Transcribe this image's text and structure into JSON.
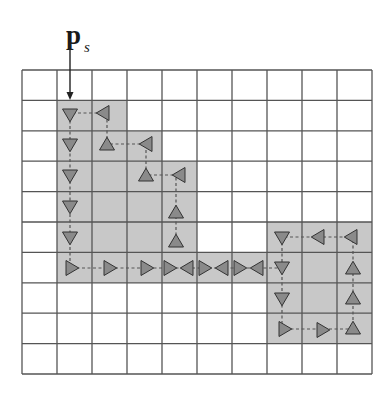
{
  "label": {
    "main": "p",
    "subscript": "s"
  },
  "grid": {
    "left": 22,
    "top": 70,
    "cols": 10,
    "rows": 10,
    "cell_w": 35,
    "cell_h": 30.4,
    "line_color": "#555555",
    "shade_color": "#c8c8c8"
  },
  "shaded_cells": [
    [
      1,
      1
    ],
    [
      2,
      1
    ],
    [
      1,
      2
    ],
    [
      2,
      2
    ],
    [
      3,
      2
    ],
    [
      1,
      3
    ],
    [
      2,
      3
    ],
    [
      3,
      3
    ],
    [
      4,
      3
    ],
    [
      1,
      4
    ],
    [
      2,
      4
    ],
    [
      3,
      4
    ],
    [
      4,
      4
    ],
    [
      1,
      5
    ],
    [
      2,
      5
    ],
    [
      3,
      5
    ],
    [
      4,
      5
    ],
    [
      7,
      5
    ],
    [
      8,
      5
    ],
    [
      9,
      5
    ],
    [
      1,
      6
    ],
    [
      2,
      6
    ],
    [
      3,
      6
    ],
    [
      4,
      6
    ],
    [
      5,
      6
    ],
    [
      6,
      6
    ],
    [
      7,
      6
    ],
    [
      8,
      6
    ],
    [
      9,
      6
    ],
    [
      7,
      7
    ],
    [
      8,
      7
    ],
    [
      9,
      7
    ],
    [
      7,
      8
    ],
    [
      8,
      8
    ],
    [
      9,
      8
    ]
  ],
  "arrow": {
    "x": 70,
    "y1": 42,
    "y2": 100
  },
  "triangle_color": "#8a8a8a",
  "triangles": [
    {
      "x": 70,
      "y": 115,
      "dir": "down"
    },
    {
      "x": 70,
      "y": 145,
      "dir": "down"
    },
    {
      "x": 70,
      "y": 176,
      "dir": "down"
    },
    {
      "x": 70,
      "y": 207,
      "dir": "down"
    },
    {
      "x": 70,
      "y": 238,
      "dir": "down"
    },
    {
      "x": 72,
      "y": 268,
      "dir": "right"
    },
    {
      "x": 103,
      "y": 113,
      "dir": "left"
    },
    {
      "x": 107,
      "y": 144,
      "dir": "up"
    },
    {
      "x": 146,
      "y": 144,
      "dir": "left"
    },
    {
      "x": 146,
      "y": 175,
      "dir": "up"
    },
    {
      "x": 179,
      "y": 175,
      "dir": "left"
    },
    {
      "x": 176,
      "y": 212,
      "dir": "up"
    },
    {
      "x": 176,
      "y": 241,
      "dir": "up"
    },
    {
      "x": 110,
      "y": 268,
      "dir": "right"
    },
    {
      "x": 147,
      "y": 268,
      "dir": "right"
    },
    {
      "x": 170,
      "y": 268,
      "dir": "right"
    },
    {
      "x": 187,
      "y": 268,
      "dir": "left"
    },
    {
      "x": 205,
      "y": 268,
      "dir": "right"
    },
    {
      "x": 222,
      "y": 268,
      "dir": "left"
    },
    {
      "x": 240,
      "y": 268,
      "dir": "right"
    },
    {
      "x": 257,
      "y": 268,
      "dir": "left"
    },
    {
      "x": 282,
      "y": 238,
      "dir": "down"
    },
    {
      "x": 318,
      "y": 237,
      "dir": "left"
    },
    {
      "x": 351,
      "y": 237,
      "dir": "left"
    },
    {
      "x": 282,
      "y": 268,
      "dir": "down"
    },
    {
      "x": 353,
      "y": 268,
      "dir": "up"
    },
    {
      "x": 282,
      "y": 299,
      "dir": "down"
    },
    {
      "x": 353,
      "y": 298,
      "dir": "up"
    },
    {
      "x": 285,
      "y": 329,
      "dir": "right"
    },
    {
      "x": 323,
      "y": 330,
      "dir": "right"
    },
    {
      "x": 353,
      "y": 328,
      "dir": "up"
    }
  ],
  "paths": [
    [
      [
        70,
        115
      ],
      [
        70,
        268
      ],
      [
        282,
        268
      ],
      [
        282,
        329
      ],
      [
        353,
        329
      ],
      [
        353,
        237
      ],
      [
        282,
        237
      ],
      [
        282,
        268
      ]
    ],
    [
      [
        103,
        113
      ],
      [
        70,
        113
      ]
    ],
    [
      [
        146,
        144
      ],
      [
        107,
        144
      ],
      [
        107,
        113
      ]
    ],
    [
      [
        179,
        175
      ],
      [
        146,
        175
      ],
      [
        146,
        144
      ]
    ],
    [
      [
        176,
        241
      ],
      [
        176,
        175
      ]
    ]
  ]
}
